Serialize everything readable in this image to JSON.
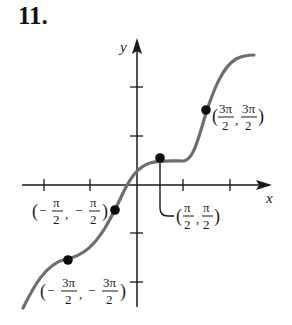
{
  "problem_number": "11.",
  "axes": {
    "x_label": "x",
    "y_label": "y",
    "x_ticks": [
      "-3π/2",
      "-π",
      "-π/2",
      "π/2",
      "π"
    ],
    "y_ticks": [
      "π",
      "π/2",
      "-π/2",
      "-π"
    ]
  },
  "points": [
    {
      "num_x": "3π",
      "den_x": "2",
      "num_y": "3π",
      "den_y": "2",
      "neg": false,
      "label": "(3π/2, 3π/2)"
    },
    {
      "num_x": "π",
      "den_x": "2",
      "num_y": "π",
      "den_y": "2",
      "neg": false,
      "label": "(π/2, π/2)"
    },
    {
      "num_x": "π",
      "den_x": "2",
      "num_y": "π",
      "den_y": "2",
      "neg": true,
      "label": "(−π/2, −π/2)"
    },
    {
      "num_x": "3π",
      "den_x": "2",
      "num_y": "3π",
      "den_y": "2",
      "neg": true,
      "label": "(−3π/2, −3π/2)"
    }
  ],
  "colors": {
    "curve": "#6e6e6e",
    "axis": "#1a1a1a",
    "point": "#0d0d0d"
  }
}
